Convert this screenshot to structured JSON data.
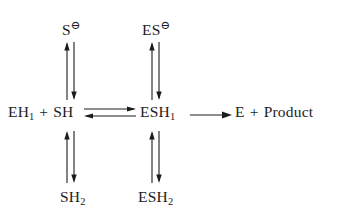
{
  "diagram": {
    "type": "reaction-scheme",
    "background_color": "#ffffff",
    "ink_color": "#1c1c1c",
    "species": {
      "top_left": {
        "label": "S",
        "charge": "⊖",
        "full": "S⊖"
      },
      "top_right": {
        "label": "ES",
        "charge": "⊖",
        "full": "ES⊖"
      },
      "mid_left_a": {
        "label": "EH",
        "sub": "1"
      },
      "mid_plus": {
        "label": "+"
      },
      "mid_left_b": {
        "label": "SH"
      },
      "mid_center": {
        "label": "ESH",
        "sub": "1"
      },
      "mid_right_a": {
        "label": "E"
      },
      "mid_right_plus": {
        "label": "+"
      },
      "mid_right_b": {
        "label": "Product"
      },
      "bottom_left": {
        "label": "SH",
        "sub": "2"
      },
      "bottom_right": {
        "label": "ESH",
        "sub": "2"
      }
    },
    "arrows": [
      {
        "name": "equilibrium-left-upper",
        "kind": "vertical-equilibrium",
        "from": "EH1 + SH",
        "to": "S⊖"
      },
      {
        "name": "equilibrium-left-lower",
        "kind": "vertical-equilibrium",
        "from": "EH1 + SH",
        "to": "SH2"
      },
      {
        "name": "equilibrium-right-upper",
        "kind": "vertical-equilibrium",
        "from": "ESH1",
        "to": "ES⊖"
      },
      {
        "name": "equilibrium-right-lower",
        "kind": "vertical-equilibrium",
        "from": "ESH1",
        "to": "ESH2"
      },
      {
        "name": "equilibrium-horizontal",
        "kind": "horizontal-equilibrium",
        "from": "EH1 + SH",
        "to": "ESH1"
      },
      {
        "name": "reaction-forward",
        "kind": "horizontal-forward",
        "from": "ESH1",
        "to": "E + Product"
      }
    ]
  }
}
